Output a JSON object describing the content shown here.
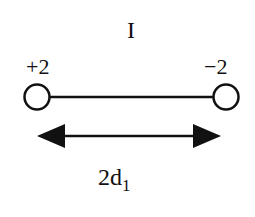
{
  "diagram": {
    "title": "I",
    "left_node": {
      "charge_label": "+2"
    },
    "right_node": {
      "charge_label": "−2"
    },
    "distance_label": {
      "base": "2d",
      "subscript": "1"
    },
    "colors": {
      "stroke": "#111111",
      "node_fill": "#ffffff",
      "background": "#ffffff"
    }
  }
}
